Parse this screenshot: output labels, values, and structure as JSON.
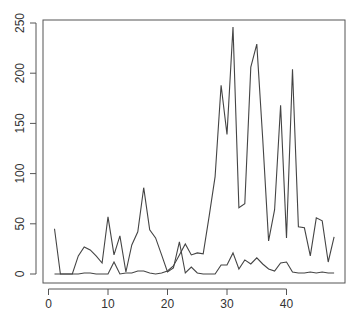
{
  "chart_data": {
    "type": "line",
    "title": "",
    "xlabel": "",
    "ylabel": "",
    "xlim": [
      0,
      48
    ],
    "ylim": [
      0,
      250
    ],
    "x_ticks": [
      0,
      10,
      20,
      30,
      40
    ],
    "y_ticks": [
      0,
      50,
      100,
      150,
      200,
      250
    ],
    "grid": false,
    "legend": null,
    "x": [
      1,
      2,
      3,
      4,
      5,
      6,
      7,
      8,
      9,
      10,
      11,
      12,
      13,
      14,
      15,
      16,
      17,
      18,
      19,
      20,
      21,
      22,
      23,
      24,
      25,
      26,
      27,
      28,
      29,
      30,
      31,
      32,
      33,
      34,
      35,
      36,
      37,
      38,
      39,
      40,
      41,
      42,
      43,
      44,
      45,
      46,
      47,
      48
    ],
    "series": [
      {
        "name": "series_1",
        "color": "#444444",
        "values": [
          45,
          0,
          0,
          0,
          18,
          27,
          24,
          18,
          11,
          57,
          19,
          38,
          2,
          29,
          42,
          86,
          44,
          36,
          19,
          2,
          6,
          32,
          1,
          7,
          1,
          0,
          0,
          0,
          9,
          9,
          21,
          5,
          14,
          10,
          16,
          10,
          5,
          3,
          11,
          12,
          2,
          1,
          1,
          2,
          1,
          2,
          1,
          1
        ]
      },
      {
        "name": "series_2",
        "color": "#444444",
        "values": [
          0,
          0,
          0,
          0,
          0,
          1,
          1,
          0,
          0,
          0,
          12,
          0,
          1,
          1,
          3,
          3,
          1,
          0,
          1,
          3,
          8,
          19,
          30,
          19,
          21,
          20,
          58,
          97,
          188,
          139,
          246,
          66,
          70,
          206,
          229,
          135,
          33,
          64,
          168,
          36,
          204,
          47,
          46,
          18,
          56,
          53,
          12,
          37
        ]
      }
    ]
  },
  "axes": {
    "x_tick_labels": [
      "0",
      "10",
      "20",
      "30",
      "40"
    ],
    "y_tick_labels": [
      "0",
      "50",
      "100",
      "150",
      "200",
      "250"
    ]
  },
  "colors": {
    "line": "#444444",
    "axis": "#555555",
    "background": "#ffffff"
  }
}
